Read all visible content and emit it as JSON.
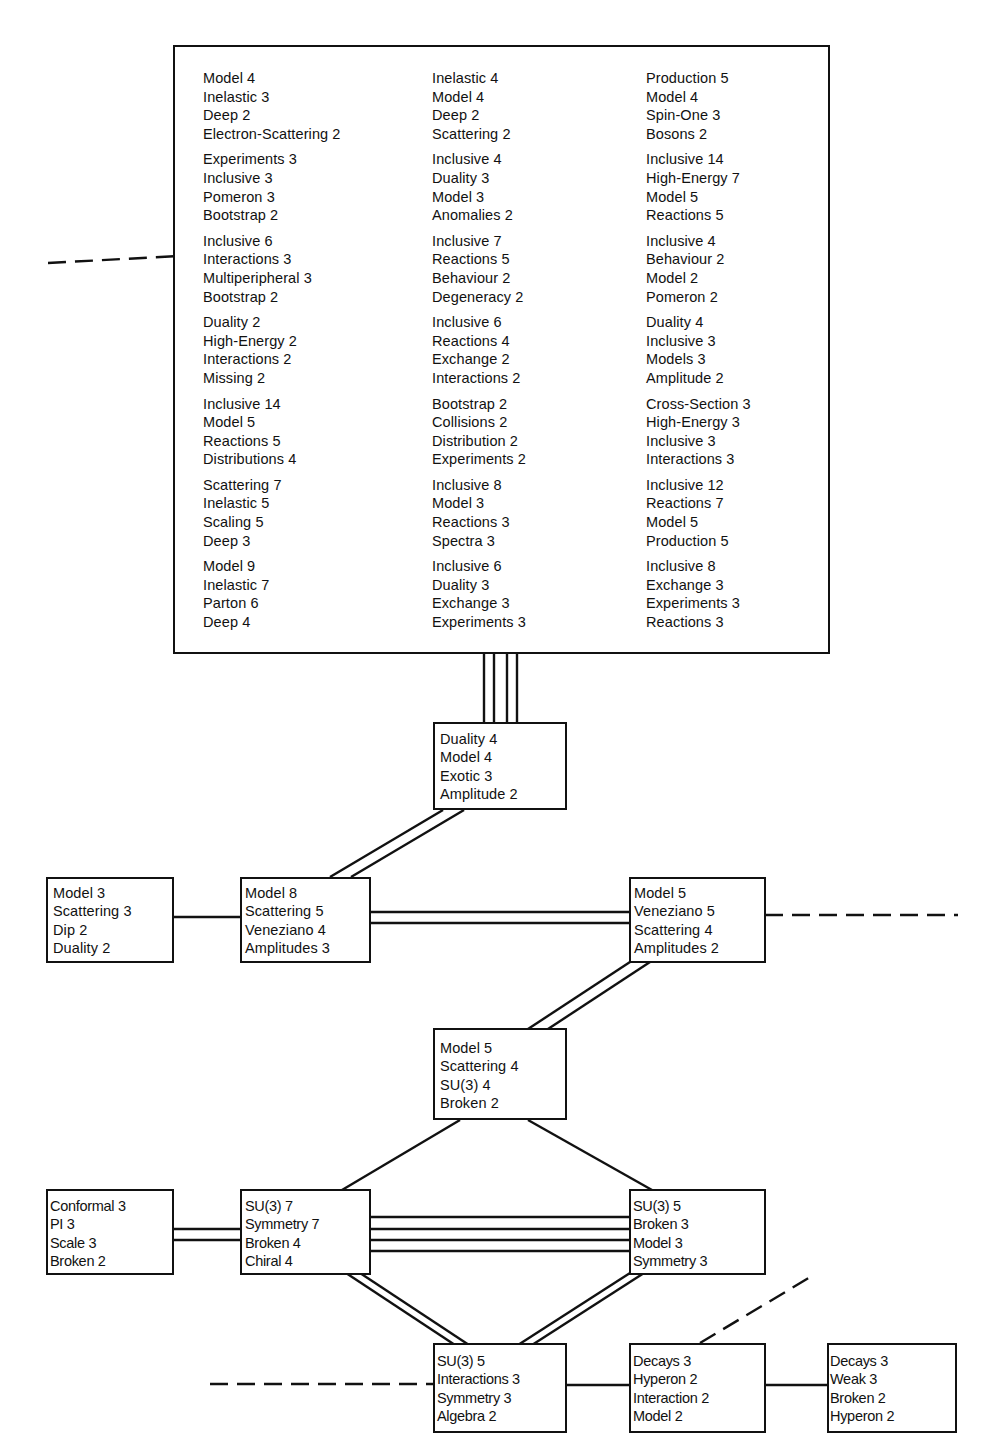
{
  "diagram": {
    "type": "cluster-network",
    "top_cluster": {
      "columns": [
        {
          "groups": [
            [
              "Model 4",
              "Inelastic 3",
              "Deep 2",
              "Electron-Scattering 2"
            ],
            [
              "Experiments 3",
              "Inclusive 3",
              "Pomeron 3",
              "Bootstrap 2"
            ],
            [
              "Inclusive 6",
              "Interactions 3",
              "Multiperipheral 3",
              "Bootstrap 2"
            ],
            [
              "Duality 2",
              "High-Energy 2",
              "Interactions 2",
              "Missing 2"
            ],
            [
              "Inclusive 14",
              "Model 5",
              "Reactions 5",
              "Distributions 4"
            ],
            [
              "Scattering 7",
              "Inelastic 5",
              "Scaling 5",
              "Deep 3"
            ],
            [
              "Model 9",
              "Inelastic 7",
              "Parton 6",
              "Deep 4"
            ]
          ]
        },
        {
          "groups": [
            [
              "Inelastic 4",
              "Model 4",
              "Deep 2",
              "Scattering 2"
            ],
            [
              "Inclusive 4",
              "Duality 3",
              "Model 3",
              "Anomalies 2"
            ],
            [
              "Inclusive 7",
              "Reactions 5",
              "Behaviour 2",
              "Degeneracy 2"
            ],
            [
              "Inclusive 6",
              "Reactions 4",
              "Exchange 2",
              "Interactions 2"
            ],
            [
              "Bootstrap 2",
              "Collisions 2",
              "Distribution 2",
              "Experiments 2"
            ],
            [
              "Inclusive 8",
              "Model 3",
              "Reactions 3",
              "Spectra 3"
            ],
            [
              "Inclusive 6",
              "Duality 3",
              "Exchange 3",
              "Experiments 3"
            ]
          ]
        },
        {
          "groups": [
            [
              "Production 5",
              "Model 4",
              "Spin-One 3",
              "Bosons 2"
            ],
            [
              "Inclusive 14",
              "High-Energy 7",
              "Model 5",
              "Reactions 5"
            ],
            [
              "Inclusive 4",
              "Behaviour 2",
              "Model 2",
              "Pomeron 2"
            ],
            [
              "Duality 4",
              "Inclusive 3",
              "Models 3",
              "Amplitude 2"
            ],
            [
              "Cross-Section 3",
              "High-Energy 3",
              "Inclusive 3",
              "Interactions 3"
            ],
            [
              "Inclusive 12",
              "Reactions 7",
              "Model 5",
              "Production 5"
            ],
            [
              "Inclusive 8",
              "Exchange 3",
              "Experiments 3",
              "Reactions 3"
            ]
          ]
        }
      ]
    },
    "nodes": {
      "duality_node": [
        "Duality 4",
        "Model 4",
        "Exotic 3",
        "Amplitude 2"
      ],
      "model3_node": [
        "Model 3",
        "Scattering 3",
        "Dip 2",
        "Duality 2"
      ],
      "model8_node": [
        "Model 8",
        "Scattering 5",
        "Veneziano 4",
        "Amplitudes 3"
      ],
      "model5_veneziano_node": [
        "Model 5",
        "Veneziano 5",
        "Scattering 4",
        "Amplitudes 2"
      ],
      "model5_su3_node": [
        "Model 5",
        "Scattering 4",
        "SU(3) 4",
        "Broken 2"
      ],
      "conformal_node": [
        "Conformal 3",
        "PI 3",
        "Scale 3",
        "Broken 2"
      ],
      "su3_7_node": [
        "SU(3) 7",
        "Symmetry 7",
        "Broken 4",
        "Chiral 4"
      ],
      "su3_5_broken_node": [
        "SU(3) 5",
        "Broken 3",
        "Model 3",
        "Symmetry 3"
      ],
      "su3_5_interactions_node": [
        "SU(3) 5",
        "Interactions 3",
        "Symmetry 3",
        "Algebra 2"
      ],
      "decays_hyperon_node": [
        "Decays 3",
        "Hyperon 2",
        "Interaction 2",
        "Model 2"
      ],
      "decays_weak_node": [
        "Decays 3",
        "Weak 3",
        "Broken 2",
        "Hyperon 2"
      ]
    },
    "links": [
      {
        "from": "top_cluster",
        "to": "duality_node",
        "strength": 4
      },
      {
        "from": "duality_node",
        "to": "model8_node",
        "strength": 2
      },
      {
        "from": "model3_node",
        "to": "model8_node",
        "strength": 1
      },
      {
        "from": "model8_node",
        "to": "model5_veneziano_node",
        "strength": 2
      },
      {
        "from": "model5_veneziano_node",
        "to": "offpage_right",
        "strength": "dashed"
      },
      {
        "from": "model5_veneziano_node",
        "to": "model5_su3_node",
        "strength": 2
      },
      {
        "from": "model5_su3_node",
        "to": "su3_7_node",
        "strength": 1
      },
      {
        "from": "model5_su3_node",
        "to": "su3_5_broken_node",
        "strength": 1
      },
      {
        "from": "conformal_node",
        "to": "su3_7_node",
        "strength": 2
      },
      {
        "from": "su3_7_node",
        "to": "su3_5_broken_node",
        "strength": 4
      },
      {
        "from": "su3_7_node",
        "to": "su3_5_interactions_node",
        "strength": 2
      },
      {
        "from": "su3_5_broken_node",
        "to": "su3_5_interactions_node",
        "strength": 2
      },
      {
        "from": "su3_5_interactions_node",
        "to": "decays_hyperon_node",
        "strength": 1
      },
      {
        "from": "decays_hyperon_node",
        "to": "decays_weak_node",
        "strength": 1
      },
      {
        "from": "offpage_left",
        "to": "su3_5_interactions_node",
        "strength": "dashed"
      },
      {
        "from": "decays_hyperon_node",
        "to": "offpage_upper_right",
        "strength": "dashed"
      },
      {
        "from": "offpage_left",
        "to": "top_cluster",
        "strength": "dashed"
      }
    ]
  }
}
